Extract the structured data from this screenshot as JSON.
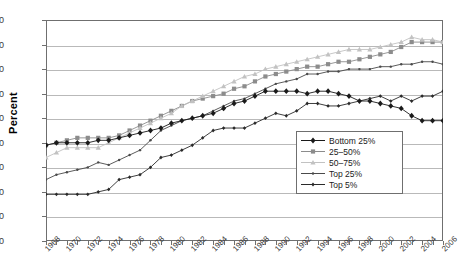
{
  "chart_data": {
    "type": "line",
    "title": "",
    "xlabel": "",
    "ylabel": "Percent",
    "ylim": [
      0,
      90
    ],
    "ytick_step": 10,
    "yticks": [
      0,
      10,
      20,
      30,
      40,
      50,
      60,
      70,
      80,
      90
    ],
    "grid": true,
    "legend_position": "inside lower-right",
    "x": [
      1968,
      1969,
      1970,
      1971,
      1972,
      1973,
      1974,
      1975,
      1976,
      1977,
      1978,
      1979,
      1980,
      1981,
      1982,
      1983,
      1984,
      1985,
      1986,
      1987,
      1988,
      1989,
      1990,
      1991,
      1992,
      1993,
      1994,
      1995,
      1996,
      1997,
      1998,
      1999,
      2000,
      2001,
      2002,
      2003,
      2004,
      2005,
      2006
    ],
    "xtick_labels": [
      "1968",
      "1970",
      "1972",
      "1974",
      "1976",
      "1978",
      "1980",
      "1982",
      "1984",
      "1986",
      "1988",
      "1990",
      "1992",
      "1994",
      "1996",
      "1998",
      "2000",
      "2002",
      "2004",
      "2006"
    ],
    "series": [
      {
        "name": "Bottom 25%",
        "color": "#1a1a1a",
        "marker": "diamond",
        "values": [
          39,
          40,
          40,
          40,
          40,
          41,
          41,
          42,
          43,
          44,
          45,
          46,
          48,
          49,
          50,
          51,
          52,
          54,
          56,
          57,
          59,
          61,
          61,
          61,
          61,
          60,
          61,
          61,
          60,
          59,
          57,
          57,
          56,
          55,
          54,
          51,
          49,
          49,
          49
        ]
      },
      {
        "name": "25-50%",
        "color": "#8c8c8c",
        "marker": "square",
        "values": [
          39,
          40,
          41,
          42,
          42,
          42,
          42,
          43,
          45,
          47,
          49,
          51,
          53,
          55,
          57,
          58,
          59,
          60,
          62,
          63,
          65,
          67,
          68,
          69,
          70,
          71,
          71,
          72,
          73,
          73,
          74,
          75,
          76,
          77,
          79,
          81,
          81,
          81,
          81
        ]
      },
      {
        "name": "50-75%",
        "color": "#c2c2c2",
        "marker": "triangle",
        "values": [
          34,
          36,
          38,
          38,
          38,
          38,
          40,
          42,
          44,
          46,
          48,
          50,
          52,
          55,
          57,
          59,
          61,
          63,
          65,
          67,
          68,
          70,
          71,
          72,
          73,
          74,
          75,
          76,
          77,
          78,
          78,
          78,
          79,
          80,
          81,
          83,
          82,
          82,
          81
        ]
      },
      {
        "name": "Top 25%",
        "color": "#4a4a4a",
        "marker": "dot",
        "values": [
          25,
          27,
          28,
          29,
          30,
          32,
          31,
          33,
          35,
          37,
          41,
          45,
          47,
          49,
          50,
          51,
          53,
          55,
          57,
          58,
          60,
          62,
          64,
          65,
          66,
          68,
          68,
          69,
          69,
          70,
          70,
          70,
          71,
          71,
          72,
          72,
          73,
          73,
          72
        ]
      },
      {
        "name": "Top 5%",
        "color": "#2a2a2a",
        "marker": "smalldiamond",
        "values": [
          19,
          19,
          19,
          19,
          19,
          20,
          21,
          25,
          26,
          27,
          30,
          34,
          35,
          37,
          39,
          42,
          45,
          46,
          46,
          46,
          48,
          50,
          52,
          51,
          53,
          56,
          56,
          55,
          55,
          56,
          57,
          58,
          59,
          57,
          59,
          57,
          59,
          59,
          61
        ]
      }
    ]
  },
  "legend": {
    "items": [
      {
        "label": "Bottom 25%"
      },
      {
        "label": "25–50%"
      },
      {
        "label": "50–75%"
      },
      {
        "label": "Top 25%"
      },
      {
        "label": "Top 5%"
      }
    ]
  },
  "axis": {
    "y_title": "Percent"
  }
}
